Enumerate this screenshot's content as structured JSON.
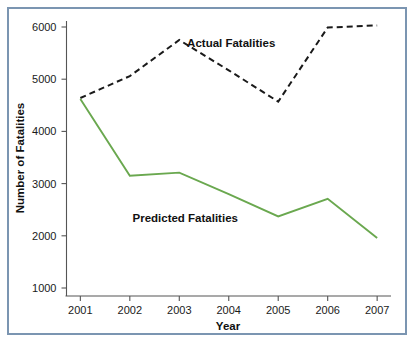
{
  "figure": {
    "border_color": "#7b95b1",
    "background": "#ffffff"
  },
  "chart_data": {
    "type": "line",
    "title": "",
    "xlabel": "Year",
    "ylabel": "Number of Fatalities",
    "categories": [
      "2001",
      "2002",
      "2003",
      "2004",
      "2005",
      "2006",
      "2007"
    ],
    "x": [
      2001,
      2002,
      2003,
      2004,
      2005,
      2006,
      2007
    ],
    "xlim": [
      2000.72,
      2007.28
    ],
    "ylim": [
      730,
      6160
    ],
    "yticks": [
      1000,
      2000,
      3000,
      4000,
      5000,
      6000
    ],
    "ytick_labels": [
      "1000",
      "2000",
      "3000",
      "4000",
      "5000",
      "6000"
    ],
    "xtick_labels": [
      "2001",
      "2002",
      "2003",
      "2004",
      "2005",
      "2006",
      "2007"
    ],
    "grid": false,
    "legend_position": "inline-annotations",
    "series": [
      {
        "name": "Actual Fatalities",
        "style": "dashed",
        "color": "#1a1a1a",
        "values": [
          4640,
          5060,
          5750,
          5170,
          4570,
          5990,
          6030
        ]
      },
      {
        "name": "Predicted Fatalities",
        "style": "solid",
        "color": "#6aa84f",
        "values": [
          4620,
          3150,
          3210,
          2800,
          2370,
          2710,
          1960
        ]
      }
    ],
    "annotations": [
      {
        "text": "Actual Fatalities",
        "x": 2004.05,
        "y": 5620
      },
      {
        "text": "Predicted Fatalities",
        "x": 2003.12,
        "y": 2270
      }
    ]
  }
}
